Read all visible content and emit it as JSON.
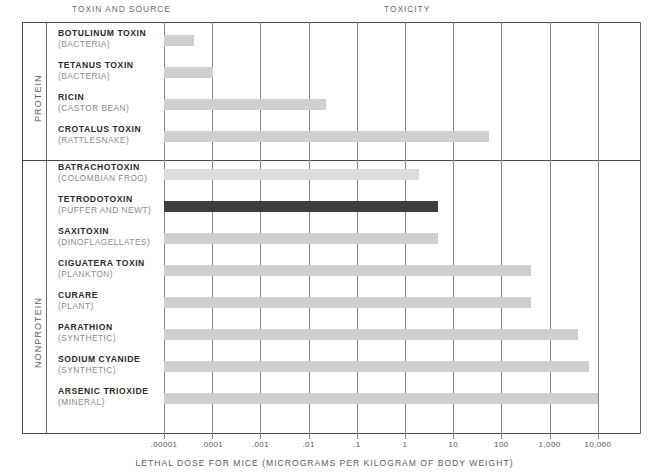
{
  "header": {
    "left_title": "TOXIN AND SOURCE",
    "right_title": "TOXICITY"
  },
  "groups": [
    {
      "label": "PROTEIN"
    },
    {
      "label": "NONPROTEIN"
    }
  ],
  "axis": {
    "title": "LETHAL DOSE FOR MICE (MICROGRAMS PER KILOGRAM OF BODY WEIGHT)",
    "tick_labels": [
      ".00001",
      ".0001",
      ".001",
      ".01",
      ".1",
      "1",
      "10",
      "100",
      "1,000",
      "10,000"
    ],
    "tick_values": [
      1e-05,
      0.0001,
      0.001,
      0.01,
      0.1,
      1,
      10,
      100,
      1000,
      10000
    ]
  },
  "colors": {
    "bar_light": "#cfcfcf",
    "bar_lighter": "#dcdcdc",
    "bar_highlight": "#3e3e3e",
    "rule": "#4a4a4a",
    "gridline": "#86868a",
    "name_text": "#2b2b2b",
    "source_text": "#8b8b8b"
  },
  "chart_data": {
    "type": "bar",
    "orientation": "horizontal",
    "title": "TOXICITY",
    "xlabel": "LETHAL DOSE FOR MICE (MICROGRAMS PER KILOGRAM OF BODY WEIGHT)",
    "ylabel": "TOXIN AND SOURCE",
    "xscale": "log",
    "xlim": [
      1e-05,
      100000
    ],
    "xticks": [
      1e-05,
      0.0001,
      0.001,
      0.01,
      0.1,
      1,
      10,
      100,
      1000,
      10000
    ],
    "xtick_labels": [
      ".00001",
      ".0001",
      ".001",
      ".01",
      ".1",
      "1",
      "10",
      "100",
      "1,000",
      "10,000"
    ],
    "grid": true,
    "legend": "none",
    "categories": [
      "BOTULINUM TOXIN",
      "TETANUS TOXIN",
      "RICIN",
      "CROTALUS TOXIN",
      "BATRACHOTOXIN",
      "TETRODOTOXIN",
      "SAXITOXIN",
      "CIGUATERA TOXIN",
      "CURARE",
      "PARATHION",
      "SODIUM CYANIDE",
      "ARSENIC TRIOXIDE"
    ],
    "values": [
      2.6e-05,
      0.0001,
      0.02,
      2.0,
      2.0,
      8.0,
      9.0,
      400,
      500,
      4000,
      7000,
      10000
    ],
    "rows": [
      {
        "name": "BOTULINUM TOXIN",
        "source": "(BACTERIA)",
        "group": "PROTEIN",
        "value": 2.6e-05,
        "bar_style": "light",
        "bar_end_px": 194
      },
      {
        "name": "TETANUS TOXIN",
        "source": "(BACTERIA)",
        "group": "PROTEIN",
        "value": 0.0001,
        "bar_style": "light",
        "bar_end_px": 213
      },
      {
        "name": "RICIN",
        "source": "(CASTOR BEAN)",
        "group": "PROTEIN",
        "value": 0.02,
        "bar_style": "light",
        "bar_end_px": 326
      },
      {
        "name": "CROTALUS TOXIN",
        "source": "(RATTLESNAKE)",
        "group": "PROTEIN",
        "value": 2.0,
        "bar_style": "light",
        "bar_end_px": 489
      },
      {
        "name": "BATRACHOTOXIN",
        "source": "(COLOMBIAN FROG)",
        "group": "NONPROTEIN",
        "value": 2.0,
        "bar_style": "lighter",
        "bar_end_px": 419
      },
      {
        "name": "TETRODOTOXIN",
        "source": "(PUFFER AND NEWT)",
        "group": "NONPROTEIN",
        "value": 8.0,
        "bar_style": "dark",
        "bar_end_px": 438
      },
      {
        "name": "SAXITOXIN",
        "source": "(DINOFLAGELLATES)",
        "group": "NONPROTEIN",
        "value": 9.0,
        "bar_style": "light",
        "bar_end_px": 438
      },
      {
        "name": "CIGUATERA TOXIN",
        "source": "(PLANKTON)",
        "group": "NONPROTEIN",
        "value": 400,
        "bar_style": "light",
        "bar_end_px": 531
      },
      {
        "name": "CURARE",
        "source": "(PLANT)",
        "group": "NONPROTEIN",
        "value": 500,
        "bar_style": "light",
        "bar_end_px": 531
      },
      {
        "name": "PARATHION",
        "source": "(SYNTHETIC)",
        "group": "NONPROTEIN",
        "value": 4000,
        "bar_style": "light",
        "bar_end_px": 578
      },
      {
        "name": "SODIUM CYANIDE",
        "source": "(SYNTHETIC)",
        "group": "NONPROTEIN",
        "value": 7000,
        "bar_style": "light",
        "bar_end_px": 589
      },
      {
        "name": "ARSENIC TRIOXIDE",
        "source": "(MINERAL)",
        "group": "NONPROTEIN",
        "value": 10000,
        "bar_style": "light",
        "bar_end_px": 598
      }
    ]
  },
  "layout": {
    "bar_origin_px": 164,
    "decade_px": 48.2,
    "row_top_px": 26,
    "row_height_px": 32,
    "protein_rows": 4,
    "group_gap_px": 6
  }
}
